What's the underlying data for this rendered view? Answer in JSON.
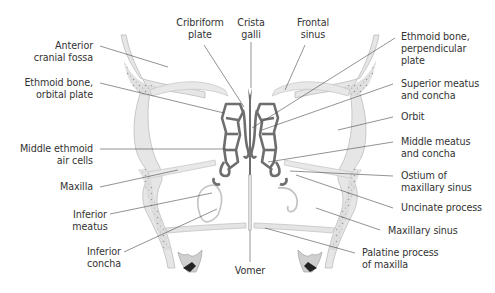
{
  "figure": {
    "colors": {
      "bone_fill": "#e4e4e4",
      "bone_stroke": "#bdbdbd",
      "ethmoid": "#6e6e6e",
      "leader": "#4a4a4a",
      "text": "#333333"
    },
    "labels": {
      "anterior_cranial_fossa": [
        "Anterior",
        "cranial fossa"
      ],
      "ethmoid_orbital_plate": [
        "Ethmoid bone,",
        "orbital plate"
      ],
      "middle_ethmoid_air_cells": [
        "Middle ethmoid",
        "air cells"
      ],
      "maxilla": [
        "Maxilla"
      ],
      "inferior_meatus": [
        "Inferior",
        "meatus"
      ],
      "inferior_concha": [
        "Inferior",
        "concha"
      ],
      "cribriform_plate": [
        "Cribriform",
        "plate"
      ],
      "crista_galli": [
        "Crista",
        "galli"
      ],
      "frontal_sinus": [
        "Frontal",
        "sinus"
      ],
      "ethmoid_perpendicular_plate": [
        "Ethmoid bone,",
        "perpendicular",
        "plate"
      ],
      "superior_meatus_concha": [
        "Superior meatus",
        "and concha"
      ],
      "orbit": [
        "Orbit"
      ],
      "middle_meatus_concha": [
        "Middle meatus",
        "and concha"
      ],
      "ostium_maxillary_sinus": [
        "Ostium of",
        "maxillary sinus"
      ],
      "uncinate_process": [
        "Uncinate process"
      ],
      "maxillary_sinus": [
        "Maxillary sinus"
      ],
      "palatine_process": [
        "Palatine process",
        "of maxilla"
      ],
      "vomer": [
        "Vomer"
      ]
    }
  }
}
